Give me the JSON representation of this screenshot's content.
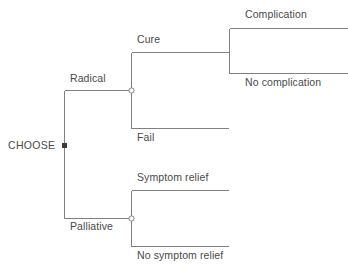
{
  "diagram": {
    "type": "decision-tree",
    "title": "CHOOSE",
    "background_color": "#ffffff",
    "line_color": "#808080",
    "text_color": "#4a4a4a",
    "node_decision_color": "#3a3a3a",
    "node_chance_fill": "#ffffff",
    "nodes": {
      "root": {
        "label": "CHOOSE",
        "shape": "square",
        "x": 64,
        "y": 145
      },
      "radical_chance": {
        "shape": "circle",
        "x": 131,
        "y": 90
      },
      "cure_chance": {
        "shape": "fork",
        "x": 229,
        "y": 52
      },
      "palliative_chance": {
        "shape": "circle",
        "x": 131,
        "y": 218
      }
    },
    "branches": {
      "radical": "Radical",
      "palliative": "Palliative",
      "cure": "Cure",
      "fail": "Fail",
      "complication": "Complication",
      "no_complication": "No complication",
      "symptom_relief": "Symptom relief",
      "no_symptom_relief": "No symptom relief"
    }
  }
}
